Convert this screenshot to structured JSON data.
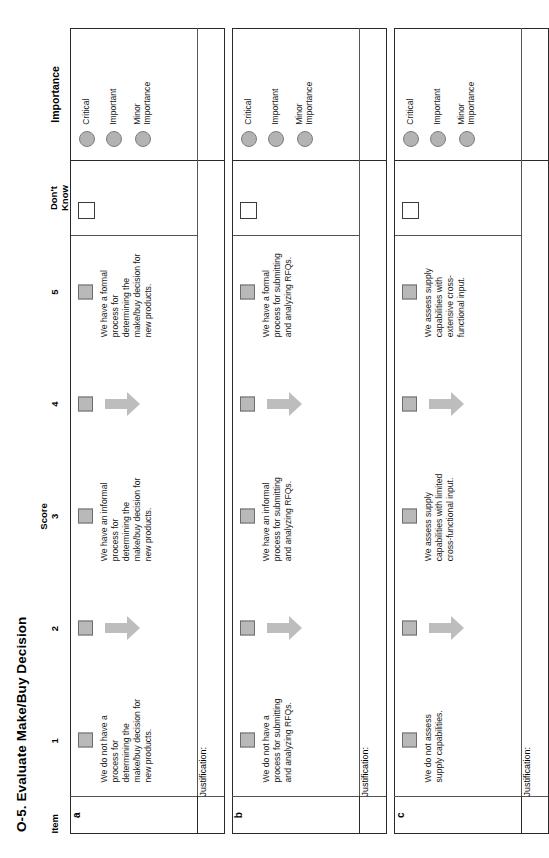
{
  "document": {
    "title": "O-5. Evaluate Make/Buy Decision"
  },
  "table": {
    "headers": {
      "item": "Item",
      "score_group": "Score",
      "scores": [
        "1",
        "2",
        "3",
        "4",
        "5"
      ],
      "dont_know_line1": "Don't",
      "dont_know_line2": "Know",
      "importance": "Importance"
    },
    "justification_label": "Justification:",
    "importance_options": [
      {
        "label": "Critical"
      },
      {
        "label": "Important"
      },
      {
        "label": "Minor Importance"
      }
    ],
    "rows": [
      {
        "id": "a",
        "statements": {
          "low": "We do not have a process for determining the make/buy decision for new products.",
          "mid": "We have an informal process for determining the make/buy decision for new products.",
          "high": "We have a formal process for determining the make/buy decision for new products."
        }
      },
      {
        "id": "b",
        "statements": {
          "low": "We do not have a process for submitting and analyzing RFQs.",
          "mid": "We have an informal process for submitting and analyzing RFQs.",
          "high": "We have a formal process for submitting and analyzing RFQs."
        }
      },
      {
        "id": "c",
        "statements": {
          "low": "We do not assess supply capabilities.",
          "mid": "We assess supply capabilities with limited cross-functional input.",
          "high": "We assess supply capabilities with extensive cross-functional input."
        }
      }
    ]
  },
  "colors": {
    "score_box_fill": "#b9b9b9",
    "score_box_border": "#6b6b6b",
    "importance_dot_fill": "#b3b3b3",
    "arrow_fill": "#bdbdbd",
    "table_border": "#2a2a2a",
    "inner_border": "#555555"
  }
}
